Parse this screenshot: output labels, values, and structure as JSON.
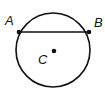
{
  "diagram": {
    "type": "circle-with-chord",
    "circle": {
      "cx": 53,
      "cy": 50,
      "r": 37
    },
    "chord": {
      "from": "A",
      "to": "B"
    },
    "points": [
      {
        "label": "A",
        "x": 19,
        "y": 32
      },
      {
        "label": "B",
        "x": 89,
        "y": 32
      },
      {
        "label": "C",
        "x": 54,
        "y": 51
      }
    ],
    "colors": {
      "stroke": "#111111",
      "background": "#ffffff"
    }
  }
}
